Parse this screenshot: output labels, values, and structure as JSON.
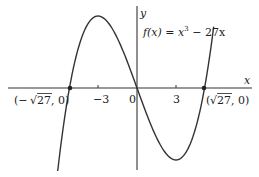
{
  "chart_data": {
    "type": "line",
    "title": "",
    "function_label": "f(x) = x³ − 27x",
    "function_label_parts": {
      "lhs": "f(x) = x",
      "exp": "3",
      "rhs": " − 27x"
    },
    "xlabel": "x",
    "ylabel": "y",
    "x_ticks": [
      {
        "value": -3,
        "label": "−3"
      },
      {
        "value": 0,
        "label": "0"
      },
      {
        "value": 3,
        "label": "3"
      }
    ],
    "annotations": [
      {
        "x": -5.196,
        "y": 0,
        "label": "(−√27, 0)",
        "parts": {
          "open": "(−",
          "root": "√",
          "rad": "27",
          "close": ", 0)"
        }
      },
      {
        "x": 5.196,
        "y": 0,
        "label": "(√27 , 0)",
        "parts": {
          "open": "(",
          "root": "√",
          "rad": "27",
          "close": " , 0)"
        }
      }
    ],
    "series": [
      {
        "name": "f(x) = x^3 - 27x",
        "x": [
          -6.1,
          -6,
          -5.5,
          -5.196,
          -5,
          -4.5,
          -4,
          -3.5,
          -3,
          -2.5,
          -2,
          -1.5,
          -1,
          -0.5,
          0,
          0.5,
          1,
          1.5,
          2,
          2.5,
          3,
          3.5,
          4,
          4.5,
          5,
          5.196,
          5.5,
          5.9
        ],
        "values": [
          -62.2,
          -54,
          -17.9,
          0,
          10,
          30.4,
          44,
          51.6,
          54,
          51.9,
          46,
          37.1,
          26,
          13.4,
          0,
          -13.4,
          -26,
          -37.1,
          -46,
          -51.9,
          -54,
          -51.6,
          -44,
          -30.4,
          -10,
          0,
          17.9,
          46.1
        ]
      }
    ],
    "key_points": {
      "local_max": {
        "x": -3,
        "y": 54
      },
      "local_min": {
        "x": 3,
        "y": -54
      },
      "origin": {
        "x": 0,
        "y": 0
      }
    },
    "xlim": [
      -10.5,
      9.3
    ],
    "ylim": [
      -66,
      66
    ],
    "grid": false,
    "legend": "none"
  }
}
